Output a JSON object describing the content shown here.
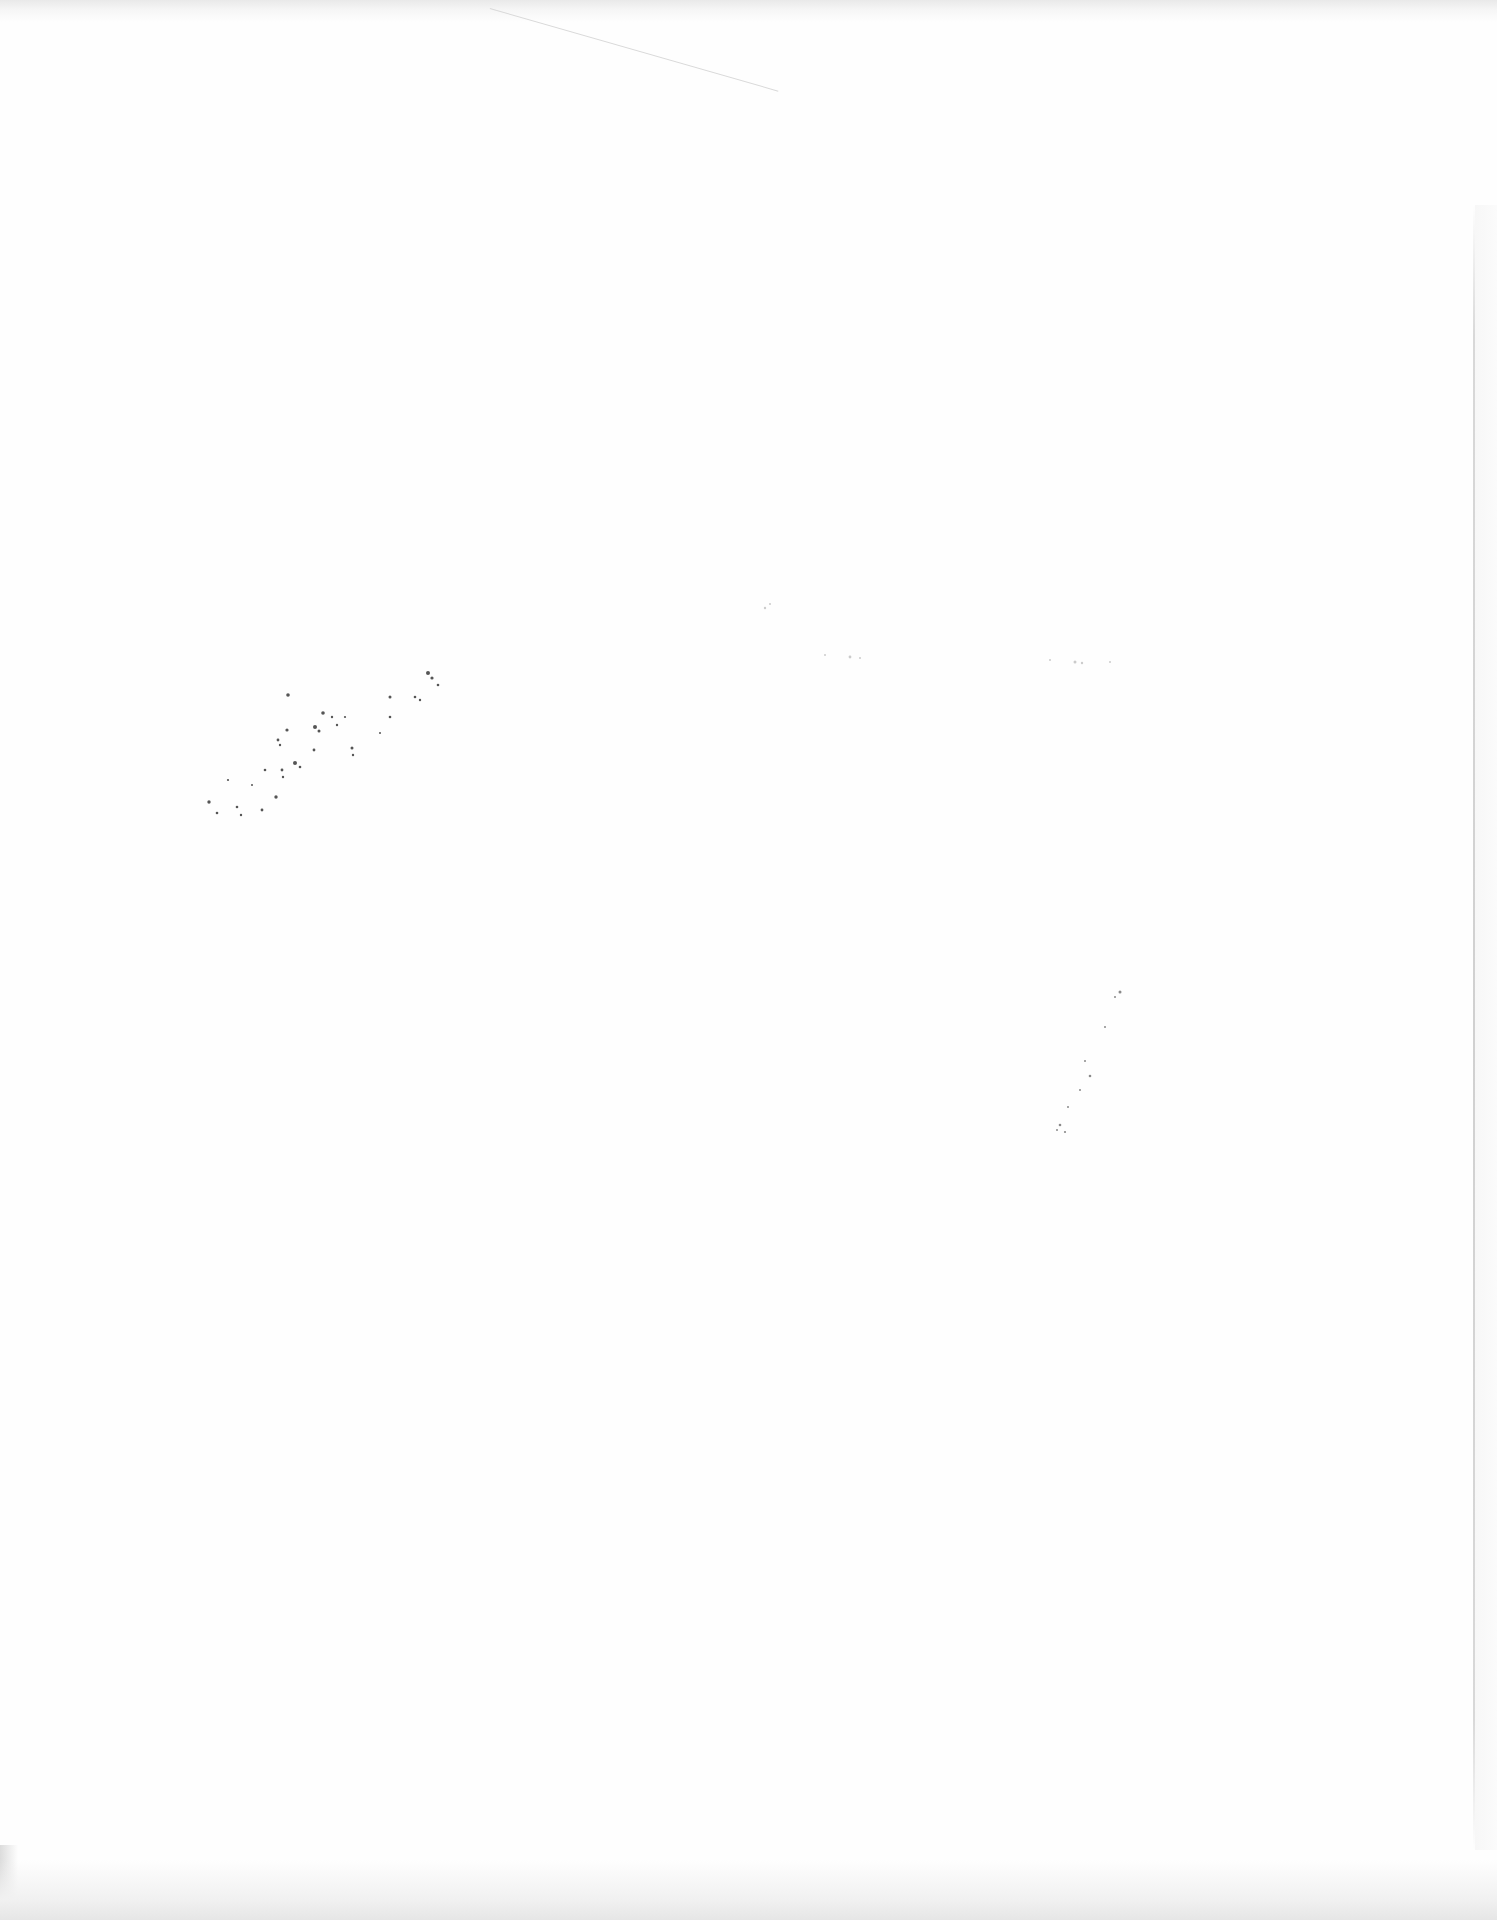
{
  "document": {
    "type": "scanned-page",
    "content": "blank",
    "visible_text": [],
    "artifacts": [
      {
        "name": "speckle-cluster",
        "description": "faint diagonal ink speckles, illegible"
      },
      {
        "name": "faint-bleed-through",
        "description": "very faint illegible marks mid-page"
      },
      {
        "name": "crease-line",
        "description": "thin diagonal crease near top edge"
      },
      {
        "name": "page-edge",
        "description": "vertical page edge line at right"
      },
      {
        "name": "scan-shadow",
        "description": "grey shadows along top and bottom edges"
      }
    ]
  },
  "colors": {
    "paper": "#fefefe",
    "shadow": "#e6e6e6",
    "speckle": "#555555"
  }
}
